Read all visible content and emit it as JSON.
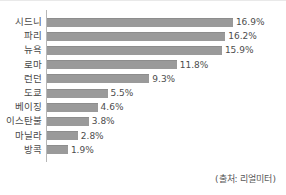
{
  "chart_data": {
    "type": "bar",
    "orientation": "horizontal",
    "title": "",
    "subtitle": "",
    "xlabel": "",
    "ylabel": "",
    "categories": [
      "시드니",
      "파리",
      "뉴욕",
      "로마",
      "런던",
      "도쿄",
      "베이징",
      "이스탄불",
      "마닐라",
      "방콕"
    ],
    "values": [
      16.9,
      16.2,
      15.9,
      11.8,
      9.3,
      5.5,
      4.6,
      3.8,
      2.8,
      1.9
    ],
    "value_labels": [
      "16.9%",
      "16.2%",
      "15.9%",
      "11.8%",
      "9.3%",
      "5.5%",
      "4.6%",
      "3.8%",
      "2.8%",
      "1.9%"
    ],
    "unit": "%",
    "xlim": [
      0,
      18
    ],
    "grid": false,
    "legend": null,
    "axis_line": "vertical-left",
    "bar_color": "#9a9a9a",
    "text_color": "#4a4a4a"
  },
  "footer": {
    "source": "(출처: 리얼미터)"
  }
}
